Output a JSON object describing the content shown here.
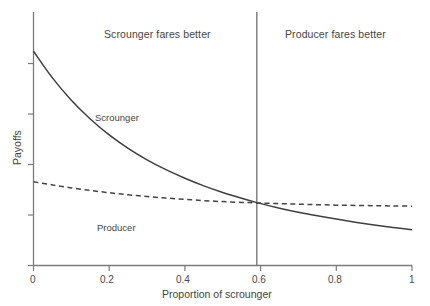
{
  "chart_data": {
    "type": "line",
    "title": "",
    "xlabel": "Proportion of scrounger",
    "ylabel": "Payoffs",
    "xlim": [
      0,
      1
    ],
    "ylim": [
      0,
      1
    ],
    "grid": false,
    "legend_position": "inline-annotations",
    "x_ticks": [
      "0",
      "0.2",
      "0.4",
      "0.6",
      "0.8",
      "1"
    ],
    "x_tick_values": [
      0,
      0.2,
      0.4,
      0.6,
      0.8,
      1
    ],
    "y_ticks": [
      "",
      "",
      "",
      "",
      ""
    ],
    "y_tick_values": [
      0.0,
      0.2,
      0.4,
      0.6,
      0.8
    ],
    "y_axis_labeled": false,
    "series": [
      {
        "name": "Scrounger",
        "style": "solid",
        "color": "#444444",
        "x": [
          0.0,
          0.05,
          0.1,
          0.15,
          0.2,
          0.25,
          0.3,
          0.35,
          0.4,
          0.45,
          0.5,
          0.55,
          0.59,
          0.65,
          0.7,
          0.75,
          0.8,
          0.85,
          0.9,
          0.95,
          1.0
        ],
        "y": [
          0.845,
          0.74,
          0.652,
          0.578,
          0.515,
          0.462,
          0.417,
          0.378,
          0.344,
          0.314,
          0.288,
          0.265,
          0.248,
          0.226,
          0.21,
          0.196,
          0.183,
          0.171,
          0.16,
          0.15,
          0.141
        ]
      },
      {
        "name": "Producer",
        "style": "dashed",
        "color": "#444444",
        "x": [
          0.0,
          0.05,
          0.1,
          0.15,
          0.2,
          0.25,
          0.3,
          0.35,
          0.4,
          0.45,
          0.5,
          0.55,
          0.59,
          0.65,
          0.7,
          0.75,
          0.8,
          0.85,
          0.9,
          0.95,
          1.0
        ],
        "y": [
          0.33,
          0.318,
          0.306,
          0.296,
          0.287,
          0.279,
          0.272,
          0.266,
          0.261,
          0.256,
          0.252,
          0.249,
          0.247,
          0.244,
          0.242,
          0.24,
          0.238,
          0.237,
          0.236,
          0.235,
          0.234
        ]
      }
    ],
    "annotations": [
      {
        "name": "scrounger-region-title",
        "text": "Scrounger fares better",
        "x": 0.28,
        "y": 1.06
      },
      {
        "name": "producer-region-title",
        "text": "Producer fares better",
        "x": 0.8,
        "y": 1.06
      },
      {
        "name": "scrounger-series-label",
        "text": "Scrounger",
        "x": 0.215,
        "y": 0.615
      },
      {
        "name": "producer-series-label",
        "text": "Producer",
        "x": 0.215,
        "y": 0.185
      }
    ],
    "reference_line": {
      "name": "equilibrium-divider",
      "orientation": "vertical",
      "x": 0.59,
      "color": "#6e6e6e"
    }
  }
}
